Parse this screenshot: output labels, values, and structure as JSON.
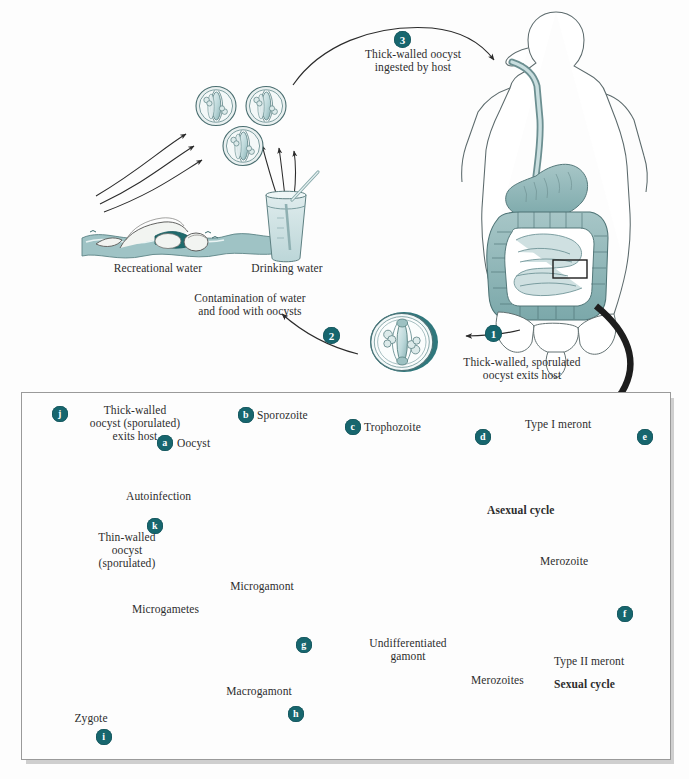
{
  "figure": {
    "background": "#fdfdfd",
    "accent": "#17666e",
    "ink": "#2d2d2d",
    "organ_fill": "#8fb7b8",
    "cell_fill": "#cfe0e2"
  },
  "upper": {
    "steps": [
      {
        "id": "3",
        "badge": "3",
        "label": "Thick-walled oocyst\ningested by host"
      },
      {
        "id": "1",
        "badge": "1",
        "label": "Thick-walled, sporulated\noocyst exits host"
      },
      {
        "id": "2",
        "badge": "2",
        "label": "Contamination of water\nand food with oocysts"
      }
    ],
    "sources": [
      {
        "id": "recreational",
        "label": "Recreational water"
      },
      {
        "id": "drinking",
        "label": "Drinking water"
      }
    ],
    "host_label": "human host"
  },
  "lower": {
    "panel_title": "Intestinal epithelium — intracellular development",
    "cycles": [
      {
        "id": "asexual",
        "label": "Asexual cycle"
      },
      {
        "id": "sexual",
        "label": "Sexual cycle"
      }
    ],
    "stages": [
      {
        "key": "a",
        "badge": "a",
        "label": "Oocyst"
      },
      {
        "key": "b",
        "badge": "b",
        "label": "Sporozoite"
      },
      {
        "key": "c",
        "badge": "c",
        "label": "Trophozoite"
      },
      {
        "key": "d",
        "badge": "d",
        "label": "Type I meront"
      },
      {
        "key": "e",
        "badge": "e",
        "label": ""
      },
      {
        "key": "f",
        "badge": "f",
        "label": "Type II meront"
      },
      {
        "key": "g",
        "badge": "g",
        "label": "Microgamont"
      },
      {
        "key": "h",
        "badge": "h",
        "label": "Macrogamont"
      },
      {
        "key": "i",
        "badge": "i",
        "label": "Zygote"
      },
      {
        "key": "j",
        "badge": "j",
        "label": "Thick-walled\noocyst (sporulated)\nexits host"
      },
      {
        "key": "k",
        "badge": "k",
        "label": "Thin-walled\noocyst\n(sporulated)"
      }
    ],
    "free_labels": [
      {
        "id": "autoinfection",
        "label": "Autoinfection"
      },
      {
        "id": "merozoite",
        "label": "Merozoite"
      },
      {
        "id": "merozoites",
        "label": "Merozoites"
      },
      {
        "id": "microgametes",
        "label": "Microgametes"
      },
      {
        "id": "undifferentiated-gamont",
        "label": "Undifferentiated\ngamont"
      }
    ]
  }
}
